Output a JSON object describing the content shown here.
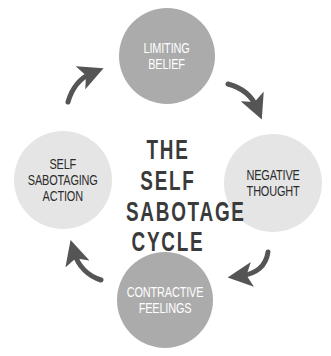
{
  "title": {
    "lines": [
      "THE SELF",
      "SABOTAGE",
      "CYCLE"
    ]
  },
  "nodes": [
    {
      "id": "top",
      "lines": [
        "LIMITING",
        "BELIEF"
      ],
      "fill": "#ababab",
      "text_color": "#ffffff"
    },
    {
      "id": "right",
      "lines": [
        "NEGATIVE",
        "THOUGHT"
      ],
      "fill": "#e5e5e5",
      "text_color": "#2b2b2b"
    },
    {
      "id": "bottom",
      "lines": [
        "CONTRACTIVE",
        "FEELINGS"
      ],
      "fill": "#ababab",
      "text_color": "#ffffff"
    },
    {
      "id": "left",
      "lines": [
        "SELF",
        "SABOTAGING",
        "ACTION"
      ],
      "fill": "#e5e5e5",
      "text_color": "#2b2b2b"
    }
  ],
  "arrows": [
    {
      "from": "left",
      "to": "top",
      "direction": "clockwise"
    },
    {
      "from": "top",
      "to": "right",
      "direction": "clockwise"
    },
    {
      "from": "right",
      "to": "bottom",
      "direction": "clockwise"
    },
    {
      "from": "bottom",
      "to": "left",
      "direction": "clockwise"
    }
  ],
  "colors": {
    "arrow": "#555555",
    "title": "#3a3a3a",
    "background": "#ffffff"
  }
}
